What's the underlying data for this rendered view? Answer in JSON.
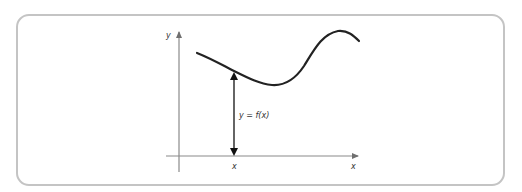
{
  "diagram": {
    "axes": {
      "y_label": "y",
      "x_label": "x"
    },
    "curve": {
      "description": "smooth curve y = f(x)"
    },
    "annotation": {
      "tick_label": "x",
      "height_label": "y = f(x)"
    },
    "colors": {
      "frame": "#c4c4c4",
      "axes": "#8a8a8a",
      "curve": "#222222",
      "arrow": "#111111",
      "text": "#333333"
    }
  }
}
